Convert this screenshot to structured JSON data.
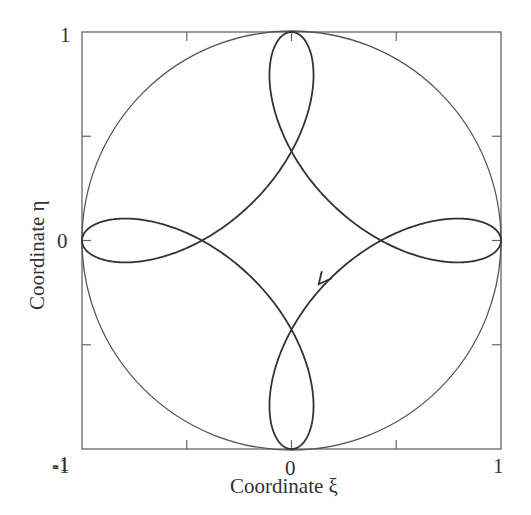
{
  "chart_data": {
    "type": "line",
    "title": "",
    "xlabel": "Coordinate ξ",
    "ylabel": "Coordinate η",
    "xlim": [
      -1,
      1
    ],
    "ylim": [
      -1,
      1
    ],
    "xticks": [
      -1,
      -0.5,
      0,
      0.5,
      1
    ],
    "yticks": [
      -1,
      -0.5,
      0,
      0.5,
      1
    ],
    "xtick_labels": [
      "-1",
      "",
      "0",
      "",
      "1"
    ],
    "ytick_labels": [
      "-1",
      "",
      "0",
      "",
      "1"
    ],
    "grid": false,
    "legend": null,
    "series": [
      {
        "name": "unit circle",
        "kind": "circle",
        "center": [
          0,
          0
        ],
        "radius": 1,
        "color": "#555555"
      },
      {
        "name": "trajectory",
        "kind": "parametric",
        "description": "four-lobed looped astroid-like trajectory touching the circle at (±1,0),(0,±1); self-intersections near (±0.43,0) and (0,±0.42)",
        "x_expr": "A*cos(t) + B*cos(3t)",
        "y_expr": "A*sin(t) - B*sin(3t)",
        "A": 0.63,
        "B": 0.37,
        "lobe_half_width": 0.07,
        "color": "#333333"
      }
    ],
    "annotations": [
      {
        "type": "arrow",
        "at": [
          0.13,
          -0.21
        ],
        "direction": "down-left along trajectory"
      }
    ]
  },
  "axes": {
    "x_left": "-1",
    "x_mid": "0",
    "x_right": "1",
    "y_top": "1",
    "y_mid": "0",
    "y_bottom": "-1",
    "xlabel": "Coordinate ξ",
    "ylabel": "Coordinate η"
  }
}
